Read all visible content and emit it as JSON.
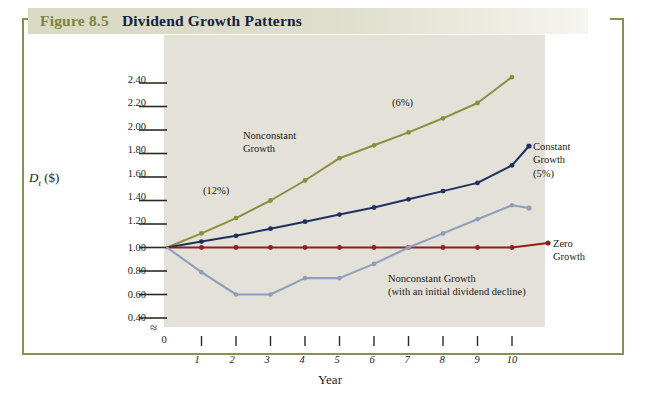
{
  "figure": {
    "number_label": "Figure 8.5",
    "title": "Dividend Growth Patterns",
    "banner_color": "#d9d9c4",
    "number_color": "#7d8440",
    "title_color": "#13213f",
    "frame_color": "#8a8f4e",
    "plot_background": "#e4e1d8"
  },
  "chart_data": {
    "type": "line",
    "title": "Dividend Growth Patterns",
    "xlabel": "Year",
    "ylabel": "Dt ($)",
    "ylabel_base": "D",
    "ylabel_sub": "t",
    "ylabel_units": "($)",
    "x": [
      0,
      1,
      2,
      3,
      4,
      5,
      6,
      7,
      8,
      9,
      10
    ],
    "xlim": [
      0,
      10
    ],
    "ylim": [
      0.4,
      2.5
    ],
    "yticks": [
      "2.40",
      "2.20",
      "2.00",
      "1.80",
      "1.60",
      "1.40",
      "1.20",
      "1.00",
      "0.80",
      "0.60",
      "0.40"
    ],
    "ytick_values": [
      2.4,
      2.2,
      2.0,
      1.8,
      1.6,
      1.4,
      1.2,
      1.0,
      0.8,
      0.6,
      0.4
    ],
    "xticks": [
      "0",
      "1",
      "2",
      "3",
      "4",
      "5",
      "6",
      "7",
      "8",
      "9",
      "10"
    ],
    "axis_break_symbol": "≈",
    "grid": false,
    "legend": "inline-annotations",
    "series": [
      {
        "name": "Nonconstant Growth",
        "color": "#8a8f3f",
        "values": [
          1.0,
          1.12,
          1.25,
          1.4,
          1.57,
          1.76,
          1.87,
          1.98,
          2.1,
          2.23,
          2.45
        ],
        "annotations": [
          "(12%)",
          "(6%)"
        ]
      },
      {
        "name": "Constant Growth (5%)",
        "color": "#1c3160",
        "values": [
          1.0,
          1.05,
          1.1,
          1.16,
          1.22,
          1.28,
          1.34,
          1.41,
          1.48,
          1.55,
          1.7
        ]
      },
      {
        "name": "Zero Growth",
        "color": "#8e1f1f",
        "values": [
          1.0,
          1.0,
          1.0,
          1.0,
          1.0,
          1.0,
          1.0,
          1.0,
          1.0,
          1.0,
          1.0
        ]
      },
      {
        "name": "Nonconstant Growth (with an initial dividend decline)",
        "color": "#8e9ebd",
        "values": [
          1.0,
          0.79,
          0.6,
          0.6,
          0.74,
          0.74,
          0.86,
          1.0,
          1.12,
          1.24,
          1.36
        ]
      }
    ],
    "annotations": [
      {
        "id": "rate-12",
        "text": "(12%)",
        "series": "Nonconstant Growth"
      },
      {
        "id": "rate-6",
        "text": "(6%)",
        "series": "Nonconstant Growth"
      },
      {
        "id": "label-nonconstant",
        "text": "Nonconstant\nGrowth",
        "line1": "Nonconstant",
        "line2": "Growth"
      },
      {
        "id": "label-constant",
        "line1": "Constant",
        "line2": "Growth",
        "line3": "(5%)"
      },
      {
        "id": "label-zero",
        "line1": "Zero",
        "line2": "Growth"
      },
      {
        "id": "label-decline",
        "line1": "Nonconstant Growth",
        "line2": "(with an initial dividend decline)"
      }
    ]
  }
}
